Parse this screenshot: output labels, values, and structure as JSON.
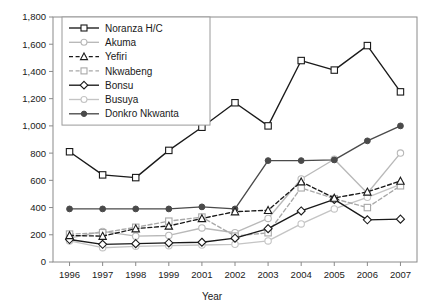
{
  "chart_data": {
    "type": "line",
    "title": "",
    "xlabel": "Year",
    "ylabel": "",
    "categories": [
      "1996",
      "1997",
      "1998",
      "1999",
      "2001",
      "2002",
      "2003",
      "2004",
      "2005",
      "2006",
      "2007"
    ],
    "ylim": [
      0,
      1800
    ],
    "yticks": [
      0,
      200,
      400,
      600,
      800,
      1000,
      1200,
      1400,
      1600,
      1800
    ],
    "ytick_labels": [
      "0",
      "200",
      "400",
      "600",
      "800",
      "1,000",
      "1,200",
      "1,400",
      "1,600",
      "1,800"
    ],
    "grid": false,
    "legend_position": "top-left",
    "series": [
      {
        "name": "Noranza H/C",
        "color": "#1a1a1a",
        "marker": "open-square",
        "dash": "solid",
        "values": [
          810,
          640,
          620,
          820,
          990,
          1170,
          1000,
          1480,
          1410,
          1590,
          1250
        ]
      },
      {
        "name": "Akuma",
        "color": "#b9b9b9",
        "marker": "open-circle",
        "dash": "solid",
        "values": [
          175,
          225,
          190,
          195,
          250,
          215,
          320,
          610,
          755,
          505,
          800
        ]
      },
      {
        "name": "Yefiri",
        "color": "#1a1a1a",
        "marker": "open-triangle",
        "dash": "dashed",
        "values": [
          195,
          190,
          245,
          265,
          320,
          370,
          380,
          590,
          470,
          515,
          595
        ]
      },
      {
        "name": "Nkwabeng",
        "color": "#a8a8a8",
        "marker": "open-square",
        "dash": "dashed",
        "values": [
          205,
          215,
          255,
          300,
          330,
          190,
          215,
          545,
          465,
          400,
          560
        ]
      },
      {
        "name": "Bonsu",
        "color": "#1a1a1a",
        "marker": "open-diamond",
        "dash": "solid",
        "values": [
          165,
          130,
          135,
          140,
          145,
          175,
          245,
          375,
          460,
          310,
          315
        ]
      },
      {
        "name": "Busuya",
        "color": "#c4c4c4",
        "marker": "open-circle",
        "dash": "solid",
        "values": [
          155,
          105,
          115,
          120,
          125,
          130,
          155,
          280,
          390,
          475,
          570
        ]
      },
      {
        "name": "Donkro Nkwanta",
        "color": "#4a4a4a",
        "marker": "filled-circle",
        "dash": "solid",
        "values": [
          390,
          390,
          390,
          390,
          405,
          390,
          745,
          745,
          750,
          890,
          1000
        ]
      }
    ]
  },
  "axes": {
    "x_axis_title": "Year"
  },
  "legend": {
    "entries": [
      {
        "label": "Noranza H/C"
      },
      {
        "label": "Akuma"
      },
      {
        "label": "Yefiri"
      },
      {
        "label": "Nkwabeng"
      },
      {
        "label": "Bonsu"
      },
      {
        "label": "Busuya"
      },
      {
        "label": "Donkro Nkwanta"
      }
    ]
  }
}
